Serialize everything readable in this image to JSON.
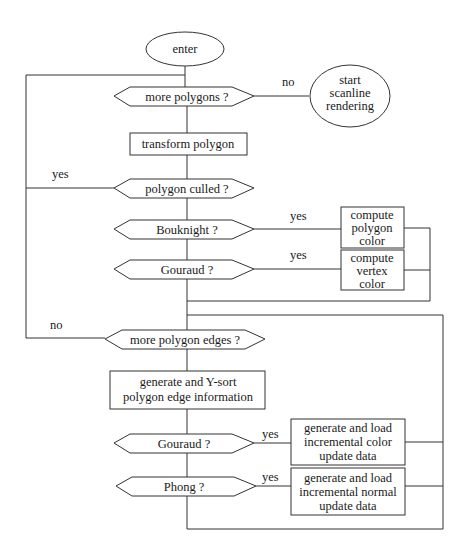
{
  "diagram": {
    "type": "flowchart",
    "nodes": {
      "enter": {
        "kind": "terminal",
        "lines": [
          "enter"
        ]
      },
      "start_scanline": {
        "kind": "terminal",
        "lines": [
          "start",
          "scanline",
          "rendering"
        ]
      },
      "more_polygons": {
        "kind": "decision",
        "lines": [
          "more polygons ?"
        ]
      },
      "transform_polygon": {
        "kind": "process",
        "lines": [
          "transform polygon"
        ]
      },
      "polygon_culled": {
        "kind": "decision",
        "lines": [
          "polygon culled ?"
        ]
      },
      "bouknight": {
        "kind": "decision",
        "lines": [
          "Bouknight ?"
        ]
      },
      "compute_polygon_color": {
        "kind": "process",
        "lines": [
          "compute",
          "polygon",
          "color"
        ]
      },
      "gouraud_1": {
        "kind": "decision",
        "lines": [
          "Gouraud ?"
        ]
      },
      "compute_vertex_color": {
        "kind": "process",
        "lines": [
          "compute",
          "vertex",
          "color"
        ]
      },
      "more_polygon_edges": {
        "kind": "decision",
        "lines": [
          "more polygon edges ?"
        ]
      },
      "generate_sort": {
        "kind": "process",
        "lines": [
          "generate and Y-sort",
          "polygon edge information"
        ]
      },
      "gouraud_2": {
        "kind": "decision",
        "lines": [
          "Gouraud ?"
        ]
      },
      "incremental_color": {
        "kind": "process",
        "lines": [
          "generate and load",
          "incremental color",
          "update data"
        ]
      },
      "phong": {
        "kind": "decision",
        "lines": [
          "Phong ?"
        ]
      },
      "incremental_normal": {
        "kind": "process",
        "lines": [
          "generate and load",
          "incremental normal",
          "update data"
        ]
      }
    },
    "edge_labels": {
      "more_polygons_no": "no",
      "polygon_culled_yes": "yes",
      "bouknight_yes": "yes",
      "gouraud_1_yes": "yes",
      "more_polygon_edges_no": "no",
      "gouraud_2_yes": "yes",
      "phong_yes": "yes"
    },
    "edges": [
      {
        "from": "enter",
        "to": "more_polygons"
      },
      {
        "from": "more_polygons",
        "to": "start_scanline",
        "label": "no"
      },
      {
        "from": "more_polygons",
        "to": "transform_polygon"
      },
      {
        "from": "transform_polygon",
        "to": "polygon_culled"
      },
      {
        "from": "polygon_culled",
        "to": "more_polygons",
        "label": "yes"
      },
      {
        "from": "polygon_culled",
        "to": "bouknight"
      },
      {
        "from": "bouknight",
        "to": "compute_polygon_color",
        "label": "yes"
      },
      {
        "from": "bouknight",
        "to": "gouraud_1"
      },
      {
        "from": "gouraud_1",
        "to": "compute_vertex_color",
        "label": "yes"
      },
      {
        "from": "compute_polygon_color",
        "to": "more_polygon_edges"
      },
      {
        "from": "compute_vertex_color",
        "to": "more_polygon_edges"
      },
      {
        "from": "gouraud_1",
        "to": "more_polygon_edges"
      },
      {
        "from": "more_polygon_edges",
        "to": "more_polygons",
        "label": "no"
      },
      {
        "from": "more_polygon_edges",
        "to": "generate_sort"
      },
      {
        "from": "generate_sort",
        "to": "gouraud_2"
      },
      {
        "from": "gouraud_2",
        "to": "incremental_color",
        "label": "yes"
      },
      {
        "from": "gouraud_2",
        "to": "phong"
      },
      {
        "from": "phong",
        "to": "incremental_normal",
        "label": "yes"
      },
      {
        "from": "incremental_color",
        "to": "more_polygon_edges"
      },
      {
        "from": "incremental_normal",
        "to": "more_polygon_edges"
      },
      {
        "from": "phong",
        "to": "more_polygon_edges"
      }
    ]
  }
}
